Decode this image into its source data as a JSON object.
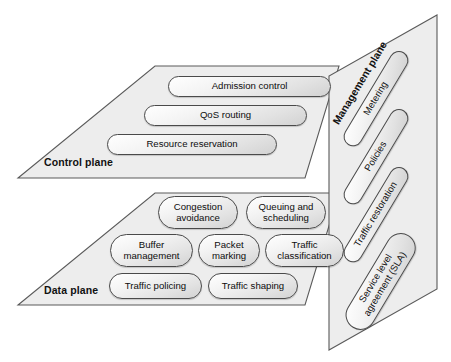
{
  "diagram": {
    "style": {
      "plane_fill": "#ededed",
      "plane_stroke": "#5a5a5a",
      "pill_stroke": "#4a4a4a",
      "background": "#ffffff"
    },
    "planes": [
      {
        "id": "control",
        "label": "Control plane",
        "items": [
          {
            "label": "Admission control",
            "lines": [
              "Admission control"
            ]
          },
          {
            "label": "QoS routing",
            "lines": [
              "QoS routing"
            ]
          },
          {
            "label": "Resource reservation",
            "lines": [
              "Resource reservation"
            ]
          }
        ]
      },
      {
        "id": "data",
        "label": "Data plane",
        "items": [
          {
            "label": "Congestion avoidance",
            "lines": [
              "Congestion",
              "avoidance"
            ]
          },
          {
            "label": "Queuing and scheduling",
            "lines": [
              "Queuing and",
              "scheduling"
            ]
          },
          {
            "label": "Buffer management",
            "lines": [
              "Buffer",
              "management"
            ]
          },
          {
            "label": "Packet marking",
            "lines": [
              "Packet",
              "marking"
            ]
          },
          {
            "label": "Traffic classification",
            "lines": [
              "Traffic",
              "classification"
            ]
          },
          {
            "label": "Traffic policing",
            "lines": [
              "Traffic policing"
            ]
          },
          {
            "label": "Traffic shaping",
            "lines": [
              "Traffic shaping"
            ]
          }
        ]
      },
      {
        "id": "management",
        "label": "Management plane",
        "items": [
          {
            "label": "Metering",
            "lines": [
              "Metering"
            ]
          },
          {
            "label": "Policies",
            "lines": [
              "Policies"
            ]
          },
          {
            "label": "Traffic restoration",
            "lines": [
              "Traffic restoration"
            ]
          },
          {
            "label": "Service level agreement (SLA)",
            "lines": [
              "Service level",
              "agreement (SLA)"
            ]
          }
        ]
      }
    ]
  }
}
